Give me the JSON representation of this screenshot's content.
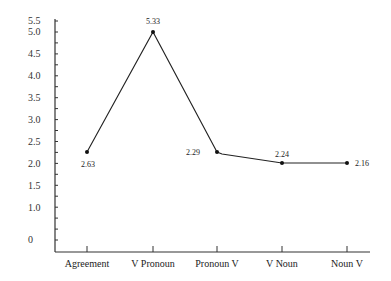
{
  "chart_data": {
    "type": "line",
    "title": "",
    "xlabel": "",
    "ylabel": "",
    "categories": [
      "Agreement",
      "V Pronoun",
      "Pronoun V",
      "V Noun",
      "Noun V"
    ],
    "values": [
      2.63,
      5.33,
      2.29,
      2.24,
      2.16
    ],
    "data_labels": [
      "2.63",
      "5.33",
      "2.29",
      "2.24",
      "2.16"
    ],
    "ylim": [
      0,
      5.5
    ],
    "yticks": [
      "0",
      "1.0",
      "1.5",
      "2.0",
      "2.5",
      "3.0",
      "3.5",
      "4.0",
      "4.5",
      "5.0",
      "5.5"
    ],
    "grid": false,
    "legend": null
  }
}
